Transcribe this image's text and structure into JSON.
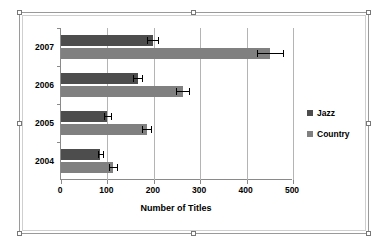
{
  "chart_data": {
    "type": "bar",
    "orientation": "horizontal",
    "title": "",
    "xlabel": "Number of Titles",
    "ylabel": "",
    "categories": [
      "2007",
      "2006",
      "2005",
      "2004"
    ],
    "xlim": [
      0,
      500
    ],
    "xticks": [
      0,
      100,
      200,
      300,
      400,
      500
    ],
    "xtick_labels": [
      "0",
      "100",
      "200",
      "300",
      "400",
      "500"
    ],
    "grid": "vertical",
    "legend_position": "right",
    "series": [
      {
        "name": "Jazz",
        "color": "#4d4d4d",
        "values": [
          198,
          165,
          100,
          85
        ],
        "errors": [
          12,
          9,
          7,
          6
        ]
      },
      {
        "name": "Country",
        "color": "#808080",
        "values": [
          450,
          262,
          185,
          112
        ],
        "errors": [
          28,
          14,
          10,
          8
        ]
      }
    ]
  },
  "legend": {
    "items": [
      {
        "label": "Jazz",
        "color": "#4d4d4d"
      },
      {
        "label": "Country",
        "color": "#808080"
      }
    ]
  },
  "axis": {
    "x_title": "Number of Titles"
  }
}
